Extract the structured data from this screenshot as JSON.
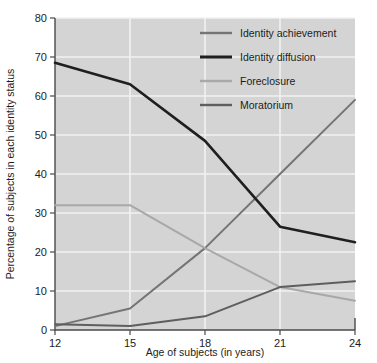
{
  "chart_data": {
    "type": "line",
    "title": "",
    "xlabel": "Age of subjects (in years)",
    "ylabel": "Percentage of subjects in each identity status",
    "x": [
      12,
      15,
      18,
      21,
      24
    ],
    "xtick_labels": [
      "12",
      "15",
      "18",
      "21",
      "24"
    ],
    "ytick_labels": [
      "0",
      "10",
      "20",
      "30",
      "40",
      "50",
      "60",
      "70",
      "80"
    ],
    "xlim": [
      12,
      24
    ],
    "ylim": [
      0,
      80
    ],
    "grid": true,
    "legend_position": "top-right",
    "plot_background": "#d4d4d4",
    "gridline_color": "#f2f2f2",
    "series": [
      {
        "name": "Identity achievement",
        "color": "#757575",
        "width": 2.0,
        "values": [
          1.0,
          5.5,
          21.0,
          40.0,
          59.0
        ]
      },
      {
        "name": "Identity diffusion",
        "color": "#1f1f1f",
        "width": 2.6,
        "values": [
          68.5,
          63.0,
          48.5,
          26.5,
          22.5
        ]
      },
      {
        "name": "Foreclosure",
        "color": "#a8a8a8",
        "width": 2.0,
        "values": [
          32.0,
          32.0,
          21.0,
          11.0,
          7.5
        ]
      },
      {
        "name": "Moratorium",
        "color": "#5e5e5e",
        "width": 2.0,
        "values": [
          1.5,
          1.0,
          3.5,
          11.0,
          12.5
        ]
      }
    ]
  },
  "legend": {
    "entries": [
      {
        "label": "Identity achievement"
      },
      {
        "label": "Identity diffusion"
      },
      {
        "label": "Foreclosure"
      },
      {
        "label": "Moratorium"
      }
    ]
  },
  "axes": {
    "x_title": "Age of subjects (in years)",
    "y_title": "Percentage of subjects in each identity status",
    "x_ticks": [
      "12",
      "15",
      "18",
      "21",
      "24"
    ],
    "y_ticks": [
      "0",
      "10",
      "20",
      "30",
      "40",
      "50",
      "60",
      "70",
      "80"
    ]
  }
}
